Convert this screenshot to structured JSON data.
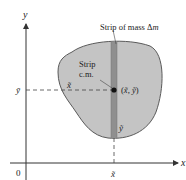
{
  "diagram": {
    "colors": {
      "region_fill": "#c4c4c4",
      "region_stroke": "#5a5a5a",
      "strip_fill": "#8f8f8f",
      "axis": "#333333",
      "text": "#222222",
      "dot": "#111111"
    },
    "axes": {
      "x_label": "x",
      "y_label": "y",
      "origin_label": "0"
    },
    "labels": {
      "strip_mass": "Strip of mass Δm",
      "strip_mass_main": "Strip of mass Δ",
      "strip_mass_var": "m",
      "strip_cm_line1": "Strip",
      "strip_cm_line2": "c.m.",
      "cm_point": "(x̃, ỹ)",
      "cm_point_open": "(",
      "cm_point_x": "x̃",
      "cm_point_sep": ", ",
      "cm_point_y": "ỹ",
      "cm_point_close": ")",
      "x_tilde_inside": "x̃",
      "y_tilde_inside": "ỹ",
      "y_bar_axis": "ȳ",
      "x_tilde_axis": "x̃"
    }
  }
}
